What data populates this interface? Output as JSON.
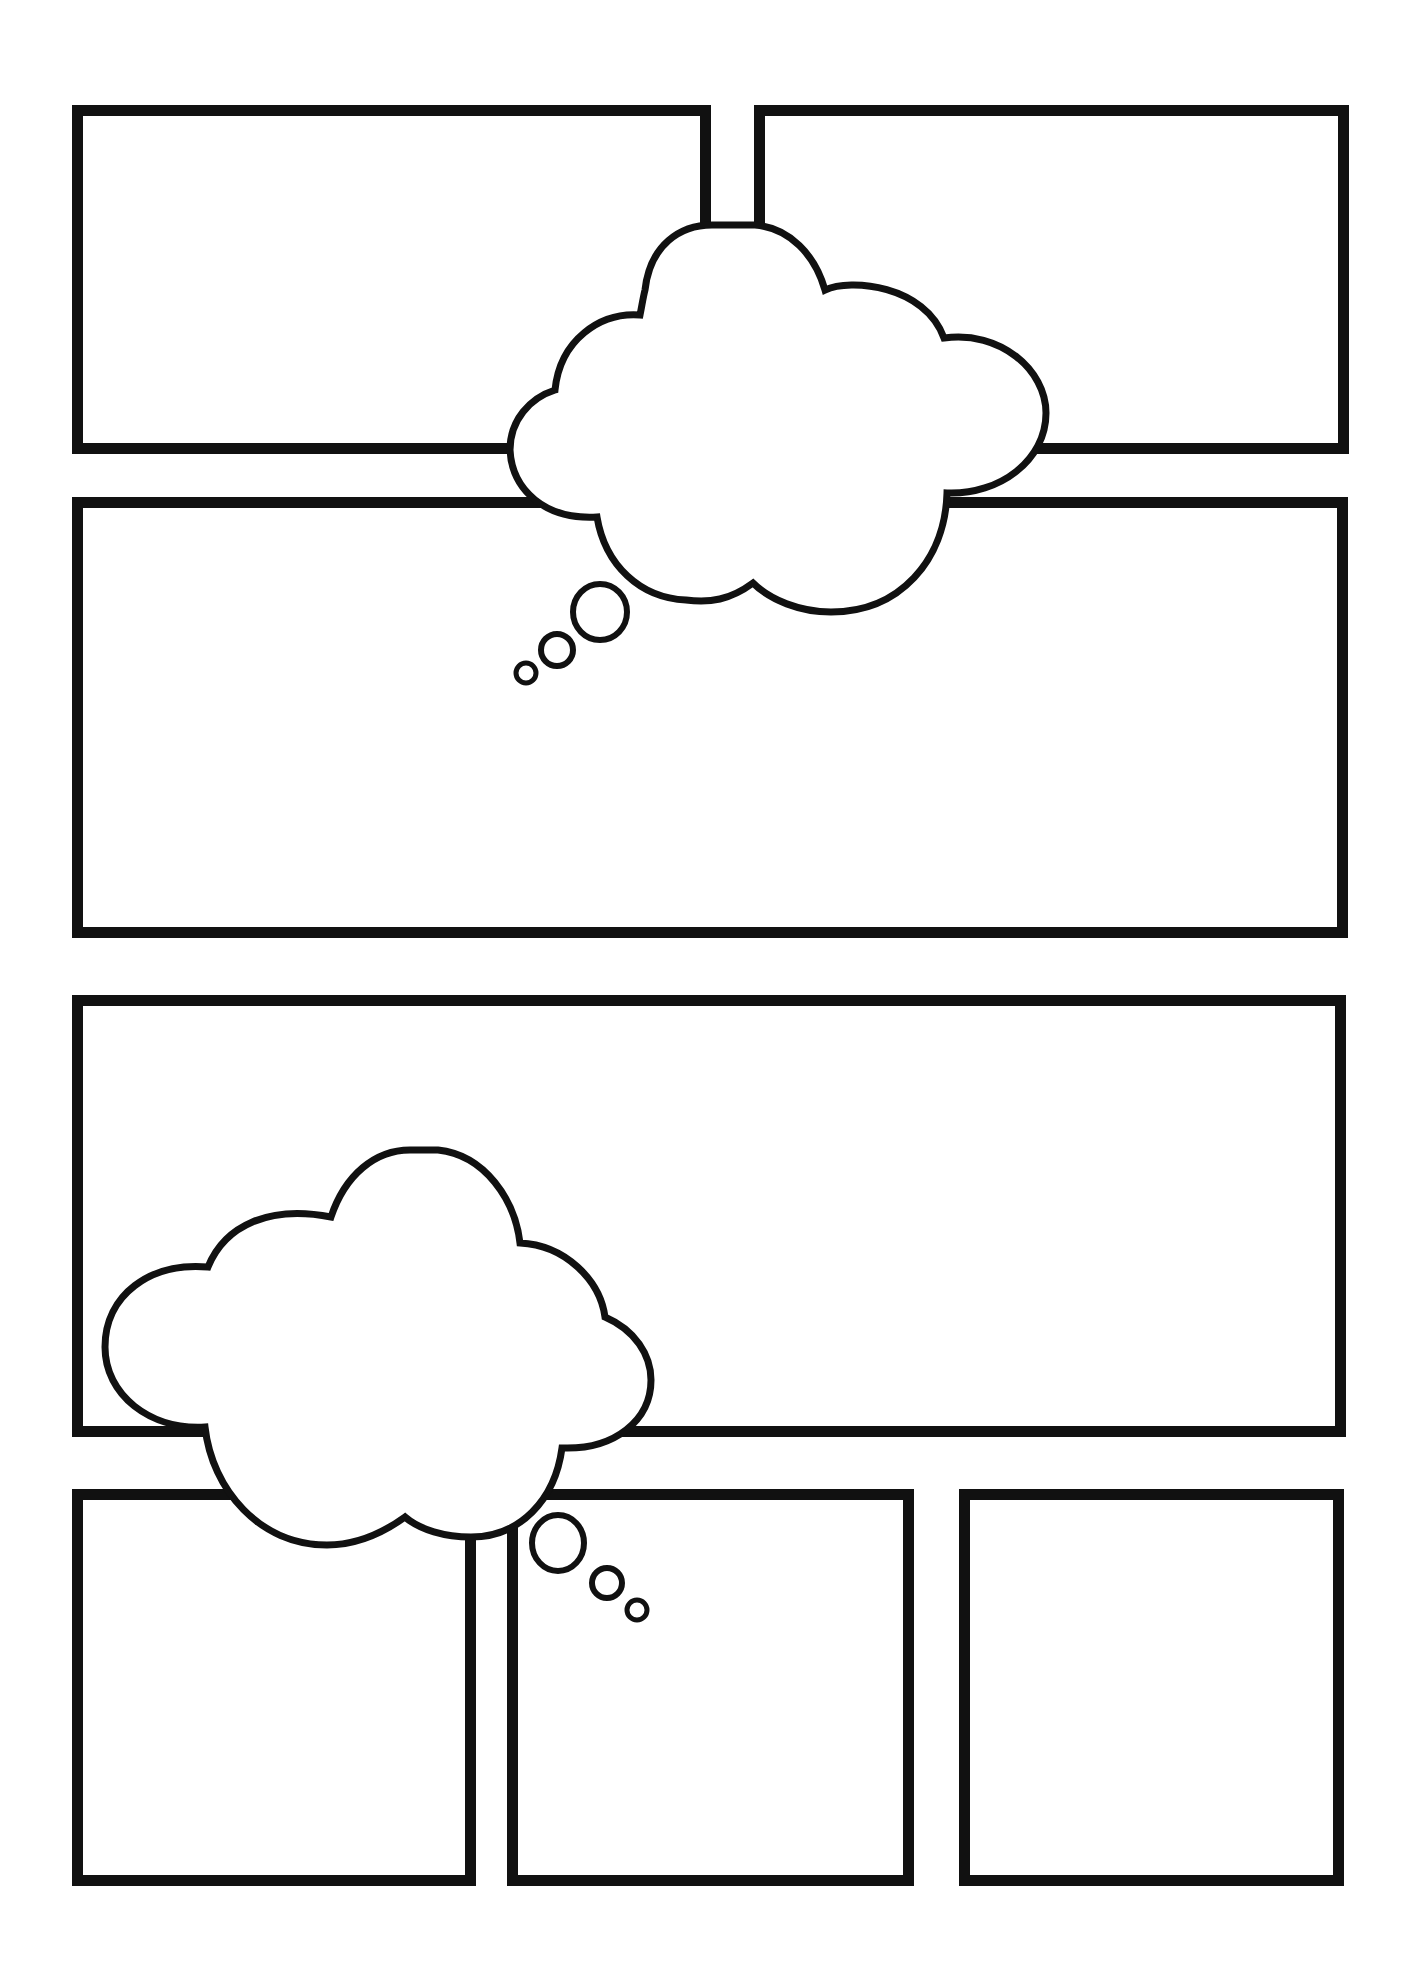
{
  "page": {
    "type": "comic-page-template",
    "background": "#ffffff",
    "stroke_color": "#111111"
  },
  "panels": [
    {
      "id": "row1-left",
      "x": 72,
      "y": 105,
      "w": 639,
      "h": 349
    },
    {
      "id": "row1-right",
      "x": 754,
      "y": 105,
      "w": 595,
      "h": 349
    },
    {
      "id": "row2",
      "x": 72,
      "y": 497,
      "w": 1276,
      "h": 441
    },
    {
      "id": "row3",
      "x": 72,
      "y": 995,
      "w": 1274,
      "h": 442
    },
    {
      "id": "row4-left",
      "x": 72,
      "y": 1489,
      "w": 404,
      "h": 397
    },
    {
      "id": "row4-mid",
      "x": 507,
      "y": 1489,
      "w": 407,
      "h": 397
    },
    {
      "id": "row4-right",
      "x": 959,
      "y": 1489,
      "w": 385,
      "h": 397
    }
  ],
  "thought_bubbles": [
    {
      "id": "thought-bubble-top",
      "text": ""
    },
    {
      "id": "thought-bubble-bottom",
      "text": ""
    }
  ]
}
